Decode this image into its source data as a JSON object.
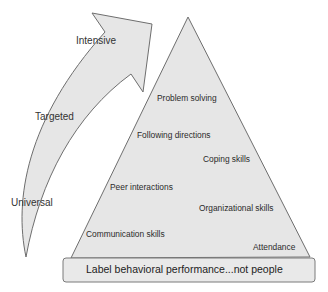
{
  "diagram": {
    "arrow": {
      "tiers": [
        {
          "label": "Intensive",
          "x": 76,
          "y": 36
        },
        {
          "label": "Targeted",
          "x": 35,
          "y": 112
        },
        {
          "label": "Universal",
          "x": 11,
          "y": 198
        }
      ]
    },
    "pyramid": {
      "skills": [
        {
          "label": "Problem solving",
          "x": 157,
          "y": 94
        },
        {
          "label": "Following directions",
          "x": 137,
          "y": 131
        },
        {
          "label": "Coping skills",
          "x": 203,
          "y": 155
        },
        {
          "label": "Peer interactions",
          "x": 110,
          "y": 183
        },
        {
          "label": "Organizational skills",
          "x": 199,
          "y": 204
        },
        {
          "label": "Communication skills",
          "x": 86,
          "y": 230
        },
        {
          "label": "Attendance",
          "x": 253,
          "y": 243
        }
      ],
      "base_label": "Label behavioral performance...not people"
    },
    "colors": {
      "fill": "#e6e6e6",
      "stroke": "#6e6e6e",
      "text": "#2b2b2b"
    }
  }
}
